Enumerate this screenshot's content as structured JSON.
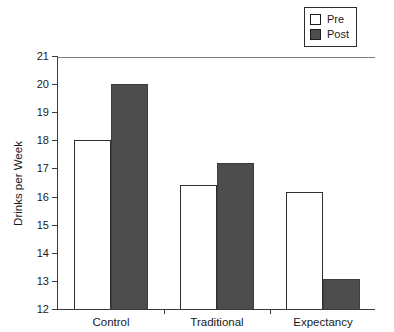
{
  "chart_data": {
    "type": "bar",
    "title": "",
    "xlabel": "",
    "ylabel": "Drinks per Week",
    "categories": [
      "Control",
      "Traditional",
      "Expectancy"
    ],
    "series": [
      {
        "name": "Pre",
        "values": [
          18.0,
          16.4,
          16.15
        ],
        "color": "#ffffff"
      },
      {
        "name": "Post",
        "values": [
          20.0,
          17.2,
          13.05
        ],
        "color": "#4d4d4d"
      }
    ],
    "ylim": [
      12,
      21
    ],
    "yticks": [
      12,
      13,
      14,
      15,
      16,
      17,
      18,
      19,
      20,
      21
    ],
    "ytick_labels": [
      "12",
      "13",
      "14",
      "15",
      "16",
      "17",
      "18",
      "19",
      "20",
      "21"
    ],
    "grid": false,
    "legend_position": "top-right",
    "legend_entries": [
      "Pre",
      "Post"
    ]
  },
  "legend": {
    "items": [
      {
        "label": "Pre",
        "swatch": "white-square-icon"
      },
      {
        "label": "Post",
        "swatch": "dark-square-icon"
      }
    ]
  }
}
